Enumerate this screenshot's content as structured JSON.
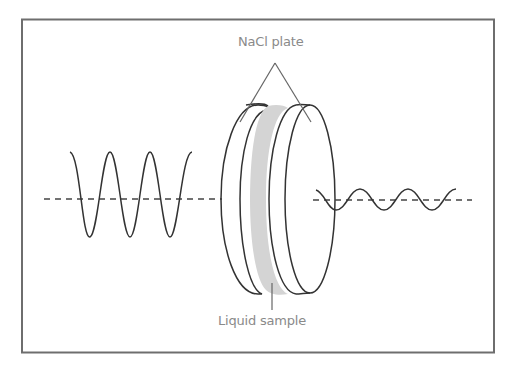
{
  "diagram": {
    "type": "ir-sample-cell",
    "labels": {
      "top": "NaCl plate",
      "bottom": "Liquid sample"
    },
    "components": [
      {
        "name": "incident-wave",
        "description": "high-amplitude sinusoidal wave entering from left"
      },
      {
        "name": "nacl-plate-left",
        "description": "first salt plate (disc)"
      },
      {
        "name": "liquid-sample-layer",
        "description": "gray film between plates"
      },
      {
        "name": "nacl-plate-right",
        "description": "second salt plate (disc)"
      },
      {
        "name": "transmitted-wave",
        "description": "attenuated low-amplitude wave exiting to right"
      },
      {
        "name": "optical-axis",
        "description": "dashed center line"
      }
    ],
    "colors": {
      "frame": "#6e6e6e",
      "stroke": "#333333",
      "sample": "#d4d4d4",
      "label": "#8a8a8a",
      "pointer": "#666666"
    }
  }
}
